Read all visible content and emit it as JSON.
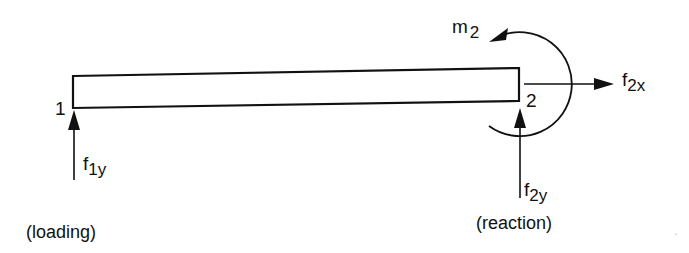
{
  "diagram": {
    "type": "beam free-body diagram",
    "colors": {
      "background": "#ffffff",
      "ink": "#111111"
    },
    "beam": {
      "label": "beam element",
      "node_labels": {
        "node1": "1",
        "node2": "2"
      }
    },
    "forces": {
      "f1y": {
        "symbol": "f",
        "subscript": "1y",
        "caption": "(loading)",
        "direction": "up"
      },
      "f2y": {
        "symbol": "f",
        "subscript": "2y",
        "caption": "(reaction)",
        "direction": "up"
      },
      "f2x": {
        "symbol": "f",
        "subscript": "2x",
        "direction": "right"
      }
    },
    "moments": {
      "m2": {
        "symbol": "m",
        "subscript": "2",
        "direction": "counterclockwise"
      }
    }
  }
}
